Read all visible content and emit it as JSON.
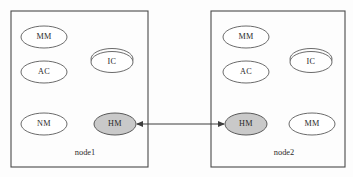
{
  "diagram": {
    "canvas": {
      "width": 353,
      "height": 177,
      "background": "#fdfdfd"
    },
    "colors": {
      "box_stroke": "#4a4a4a",
      "ellipse_stroke": "#5a5a5a",
      "ellipse_fill": "#ffffff",
      "shaded_fill": "#c9c9c9",
      "link_stroke": "#3d3d3d",
      "text": "#2b2b2b"
    },
    "nodes": [
      {
        "id": "node1",
        "label": "node1",
        "box": {
          "x": 11,
          "y": 11,
          "width": 137,
          "height": 156
        },
        "label_pos": {
          "x": 85,
          "y": 153
        },
        "components": [
          {
            "id": "node1-mm",
            "label": "MM",
            "cx": 44,
            "cy": 37,
            "rx": 23,
            "ry": 11,
            "shaded": false,
            "double_outline": false
          },
          {
            "id": "node1-ac",
            "label": "AC",
            "cx": 44,
            "cy": 72,
            "rx": 23,
            "ry": 11,
            "shaded": false,
            "double_outline": false
          },
          {
            "id": "node1-ic",
            "label": "IC",
            "cx": 112,
            "cy": 61,
            "rx": 21,
            "ry": 11,
            "shaded": false,
            "double_outline": true
          },
          {
            "id": "node1-nm",
            "label": "NM",
            "cx": 44,
            "cy": 124,
            "rx": 23,
            "ry": 11,
            "shaded": false,
            "double_outline": false
          },
          {
            "id": "node1-hm",
            "label": "HM",
            "cx": 115,
            "cy": 124,
            "rx": 21,
            "ry": 11,
            "shaded": true,
            "double_outline": false
          }
        ]
      },
      {
        "id": "node2",
        "label": "node2",
        "box": {
          "x": 211,
          "y": 11,
          "width": 134,
          "height": 156
        },
        "label_pos": {
          "x": 284,
          "y": 153
        },
        "components": [
          {
            "id": "node2-mm-top",
            "label": "MM",
            "cx": 246,
            "cy": 37,
            "rx": 23,
            "ry": 11,
            "shaded": false,
            "double_outline": false
          },
          {
            "id": "node2-ac",
            "label": "AC",
            "cx": 246,
            "cy": 72,
            "rx": 23,
            "ry": 11,
            "shaded": false,
            "double_outline": false
          },
          {
            "id": "node2-ic",
            "label": "IC",
            "cx": 311,
            "cy": 61,
            "rx": 21,
            "ry": 11,
            "shaded": false,
            "double_outline": true
          },
          {
            "id": "node2-hm",
            "label": "HM",
            "cx": 246,
            "cy": 124,
            "rx": 21,
            "ry": 11,
            "shaded": true,
            "double_outline": false
          },
          {
            "id": "node2-mm-bottom",
            "label": "MM",
            "cx": 312,
            "cy": 124,
            "rx": 23,
            "ry": 11,
            "shaded": false,
            "double_outline": false
          }
        ]
      }
    ],
    "link": {
      "id": "hm-hm-link",
      "label": "",
      "from": "node1-hm",
      "to": "node2-hm",
      "x1": 137,
      "x2": 224,
      "y": 124,
      "bidirectional": true
    }
  }
}
